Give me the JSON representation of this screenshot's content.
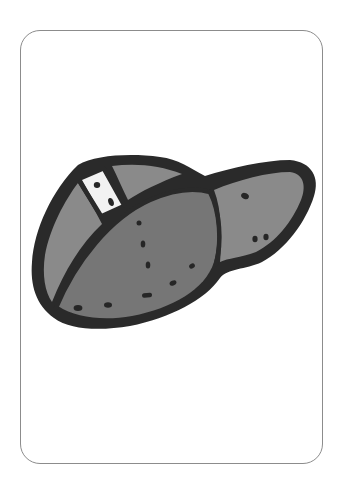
{
  "card": {
    "subject": "baseball cap",
    "border_color": "#8c8c8c",
    "background": "#ffffff"
  },
  "illustration": {
    "name": "baseball-cap",
    "colors": {
      "outline": "#2a2a2a",
      "crown_front": "#767676",
      "side_panel": "#8a8a8a",
      "brim": "#8a8a8a",
      "tag": "#f2f2f2",
      "stitch": "#262626"
    }
  }
}
